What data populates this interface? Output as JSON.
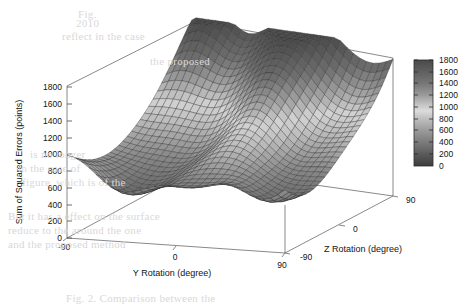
{
  "figure": {
    "kind": "3d-surface-plot",
    "renderer": "gnuplot-pm3d",
    "background": "#ffffff",
    "line_color": "#555555",
    "mesh_color": "#2a2a2a"
  },
  "chart_data": {
    "type": "heatmap",
    "subtype": "3d-surface",
    "title": "",
    "xlabel": "Y Rotation (degree)",
    "ylabel": "Z Rotation (degree)",
    "zlabel": "Sum of Squared Errors (points)",
    "xlim": [
      -90,
      90
    ],
    "ylim": [
      -90,
      90
    ],
    "zlim": [
      0,
      1800
    ],
    "xticks": [
      "-90",
      "0",
      "90"
    ],
    "yticks": [
      "-90",
      "0",
      "90"
    ],
    "zticks": [
      "0",
      "200",
      "400",
      "600",
      "800",
      "1000",
      "1200",
      "1400",
      "1600",
      "1800"
    ],
    "grid": false,
    "legend": "colorbar-right",
    "colorbar": {
      "min": 0,
      "max": 1800,
      "ticks": [
        "1800",
        "1600",
        "1400",
        "1200",
        "1000",
        "800",
        "600",
        "400",
        "200",
        "0"
      ],
      "scheme": "grayscale-gnuplot",
      "stops": [
        {
          "value": 1800,
          "color": "#4a4a4a"
        },
        {
          "value": 1500,
          "color": "#6e6e6e"
        },
        {
          "value": 1250,
          "color": "#a8a8a8"
        },
        {
          "value": 1100,
          "color": "#d2d2d2"
        },
        {
          "value": 950,
          "color": "#bdbdbd"
        },
        {
          "value": 700,
          "color": "#8a8a8a"
        },
        {
          "value": 400,
          "color": "#5c5c5c"
        },
        {
          "value": 0,
          "color": "#3a3a3a"
        }
      ]
    },
    "mesh": {
      "x_samples": 31,
      "y_samples": 31,
      "hidden3d": true,
      "surface_min_z": 180,
      "surface_max_z": 1800
    }
  },
  "axes": {
    "z_axis": {
      "name": "Sum of Squared Errors (points)",
      "ticks": [
        {
          "label": "1800",
          "value": 1800
        },
        {
          "label": "1600",
          "value": 1600
        },
        {
          "label": "1400",
          "value": 1400
        },
        {
          "label": "1200",
          "value": 1200
        },
        {
          "label": "1000",
          "value": 1000
        },
        {
          "label": "800",
          "value": 800
        },
        {
          "label": "600",
          "value": 600
        },
        {
          "label": "400",
          "value": 400
        },
        {
          "label": "200",
          "value": 200
        },
        {
          "label": "0",
          "value": 0
        }
      ]
    },
    "x_axis": {
      "name": "Y Rotation (degree)",
      "ticks": [
        {
          "label": "-90",
          "value": -90
        },
        {
          "label": "0",
          "value": 0
        },
        {
          "label": "90",
          "value": 90
        }
      ]
    },
    "y_axis": {
      "name": "Z Rotation (degree)",
      "ticks": [
        {
          "label": "-90",
          "value": -90
        },
        {
          "label": "0",
          "value": 0
        },
        {
          "label": "90",
          "value": 90
        }
      ]
    }
  },
  "colorbar_labels": [
    "1800",
    "1600",
    "1400",
    "1200",
    "1000",
    "800",
    "600",
    "400",
    "200",
    "0"
  ],
  "page_bleed": {
    "note": "faint show-through text from the reverse of the scanned page",
    "lines": [
      {
        "text": "Fig.",
        "x": 78,
        "y": 8
      },
      {
        "text": "2010",
        "x": 76,
        "y": 17
      },
      {
        "text": "reflect in the case",
        "x": 62,
        "y": 30
      },
      {
        "text": "the proposed",
        "x": 150,
        "y": 55
      },
      {
        "text": "is no longer",
        "x": 30,
        "y": 148
      },
      {
        "text": "in the case of",
        "x": 18,
        "y": 162
      },
      {
        "text": "figure, which is of the",
        "x": 22,
        "y": 176
      },
      {
        "text": "But it has a effect on the surface",
        "x": 8,
        "y": 210
      },
      {
        "text": "reduce to the around the one",
        "x": 8,
        "y": 224
      },
      {
        "text": "and the proposed method",
        "x": 8,
        "y": 238
      },
      {
        "text": "Fig. 2. Comparison between the",
        "x": 66,
        "y": 292
      }
    ]
  }
}
